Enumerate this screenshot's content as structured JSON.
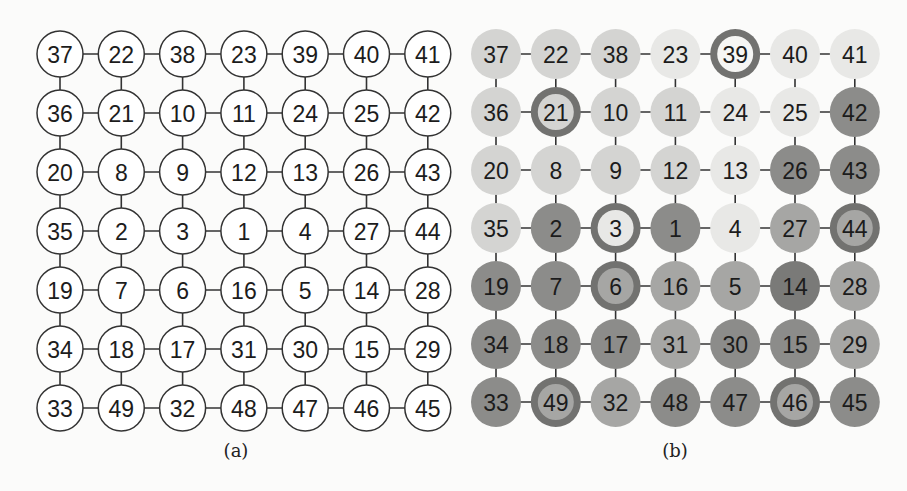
{
  "figure": {
    "panels": [
      {
        "id": "a",
        "caption": "(a)",
        "style": "outline",
        "grid": [
          [
            37,
            22,
            38,
            23,
            39,
            40,
            41
          ],
          [
            36,
            21,
            10,
            11,
            24,
            25,
            42
          ],
          [
            20,
            8,
            9,
            12,
            13,
            26,
            43
          ],
          [
            35,
            2,
            3,
            1,
            4,
            27,
            44
          ],
          [
            19,
            7,
            6,
            16,
            5,
            14,
            28
          ],
          [
            34,
            18,
            17,
            31,
            30,
            15,
            29
          ],
          [
            33,
            49,
            32,
            48,
            47,
            46,
            45
          ]
        ]
      },
      {
        "id": "b",
        "caption": "(b)",
        "style": "shaded",
        "grid": [
          [
            37,
            22,
            38,
            23,
            39,
            40,
            41
          ],
          [
            36,
            21,
            10,
            11,
            24,
            25,
            42
          ],
          [
            20,
            8,
            9,
            12,
            13,
            26,
            43
          ],
          [
            35,
            2,
            3,
            1,
            4,
            27,
            44
          ],
          [
            19,
            7,
            6,
            16,
            5,
            14,
            28
          ],
          [
            34,
            18,
            17,
            31,
            30,
            15,
            29
          ],
          [
            33,
            49,
            32,
            48,
            47,
            46,
            45
          ]
        ],
        "shade_levels": [
          [
            2,
            2,
            2,
            1,
            1,
            1,
            1
          ],
          [
            2,
            2,
            2,
            2,
            1,
            1,
            4
          ],
          [
            2,
            2,
            2,
            2,
            1,
            4,
            4
          ],
          [
            2,
            4,
            2,
            4,
            1,
            3,
            3
          ],
          [
            4,
            4,
            3,
            3,
            3,
            5,
            3
          ],
          [
            4,
            4,
            4,
            3,
            4,
            4,
            3
          ],
          [
            4,
            4,
            3,
            4,
            4,
            4,
            4
          ]
        ],
        "ringed_nodes": [
          39,
          21,
          3,
          44,
          6,
          49,
          46
        ],
        "ring_inner_levels": {
          "39": 0,
          "21": 2,
          "3": 1,
          "44": 3,
          "6": 3,
          "49": 3,
          "46": 3
        },
        "shade_colors": [
          "#f6f6f4",
          "#e8e8e6",
          "#d4d4d2",
          "#a6a6a4",
          "#8c8c8a",
          "#7a7a78"
        ],
        "ring_color": "#727270"
      }
    ]
  }
}
